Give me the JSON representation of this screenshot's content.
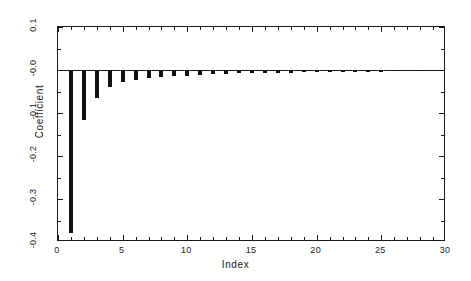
{
  "chart_data": {
    "type": "bar",
    "title": "",
    "subtitle": "",
    "xlabel": "Index",
    "ylabel": "Coefficient",
    "xlim": [
      0,
      30
    ],
    "ylim": [
      -0.4,
      0.1
    ],
    "grid": false,
    "legend": null,
    "annotations": [],
    "zero_reference_line": 0.0,
    "xticks": [
      0,
      5,
      10,
      15,
      20,
      25,
      30
    ],
    "xtick_labels": [
      "0",
      "5",
      "10",
      "15",
      "20",
      "25",
      "30"
    ],
    "xminor_tick_step": 1,
    "yticks": [
      0.1,
      -0.0,
      -0.1,
      -0.2,
      -0.3,
      -0.4
    ],
    "ytick_labels": [
      "0.1",
      "-0.0",
      "-0.1",
      "-0.2",
      "-0.3",
      "-0.4"
    ],
    "yminor_tick_step": 0.05,
    "bar_color": "#111111",
    "axis_color": "#1a1a1a",
    "background_color": "#ffffff",
    "bar_width_units": 0.3,
    "categories": [
      1,
      2,
      3,
      4,
      5,
      6,
      7,
      8,
      9,
      10,
      11,
      12,
      13,
      14,
      15,
      16,
      17,
      18,
      19,
      20,
      21,
      22,
      23,
      24,
      25,
      26,
      27,
      28,
      29,
      30
    ],
    "values": [
      -0.38,
      -0.116,
      -0.064,
      -0.04,
      -0.027,
      -0.023,
      -0.019,
      -0.016,
      -0.014,
      -0.013,
      -0.011,
      -0.01,
      -0.009,
      -0.008,
      -0.008,
      -0.007,
      -0.006,
      -0.006,
      -0.005,
      -0.005,
      -0.005,
      -0.004,
      -0.004,
      -0.004,
      -0.004,
      -0.003,
      -0.003,
      -0.003,
      -0.003,
      -0.003
    ]
  },
  "figure": {
    "name": "coefficient-vs-index-bar-chart"
  }
}
